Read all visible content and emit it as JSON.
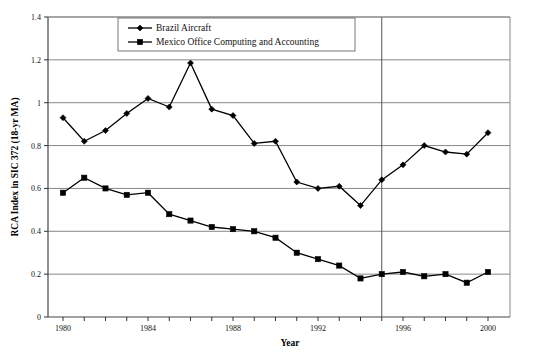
{
  "chart_data": {
    "type": "line",
    "title": "",
    "xlabel": "Year",
    "ylabel": "RCA Index in SIC 372 (18-yr MA)",
    "xlim": [
      1980,
      2000
    ],
    "ylim": [
      0,
      1.4
    ],
    "grid": true,
    "grid_axis": "y",
    "legend_position": "top-center",
    "x": [
      1980,
      1981,
      1982,
      1983,
      1984,
      1985,
      1986,
      1987,
      1988,
      1989,
      1990,
      1991,
      1992,
      1993,
      1994,
      1995,
      1996,
      1997,
      1998,
      1999,
      2000
    ],
    "xticks_labeled": [
      "1980",
      "1984",
      "1988",
      "1992",
      "1996",
      "2000"
    ],
    "xticks_labeled_values": [
      1980,
      1984,
      1988,
      1992,
      1996,
      2000
    ],
    "yticks": [
      "0",
      "0.2",
      "0.4",
      "0.6",
      "0.8",
      "1",
      "1.2",
      "1.4"
    ],
    "ytick_values": [
      0,
      0.2,
      0.4,
      0.6,
      0.8,
      1.0,
      1.2,
      1.4
    ],
    "annotations": [
      {
        "name": "vertical-reference-line",
        "type": "vline",
        "x": 1995
      }
    ],
    "series": [
      {
        "name": "Brazil Aircraft",
        "marker": "diamond",
        "color": "#000000",
        "values": [
          0.93,
          0.82,
          0.87,
          0.95,
          1.02,
          0.98,
          1.185,
          0.97,
          0.94,
          0.81,
          0.82,
          0.63,
          0.6,
          0.61,
          0.52,
          0.64,
          0.71,
          0.8,
          0.77,
          0.76,
          0.86
        ]
      },
      {
        "name": "Mexico Office Computing and Accounting",
        "marker": "square",
        "color": "#000000",
        "values": [
          0.58,
          0.65,
          0.6,
          0.57,
          0.58,
          0.48,
          0.45,
          0.42,
          0.41,
          0.4,
          0.37,
          0.3,
          0.27,
          0.24,
          0.18,
          0.2,
          0.21,
          0.19,
          0.2,
          0.16,
          0.21
        ]
      }
    ]
  },
  "legend": {
    "entries": [
      {
        "label": "Brazil Aircraft"
      },
      {
        "label": "Mexico Office Computing and Accounting"
      }
    ]
  },
  "axes": {
    "x_title": "Year",
    "y_title": "RCA Index in SIC 372 (18-yr MA)"
  }
}
